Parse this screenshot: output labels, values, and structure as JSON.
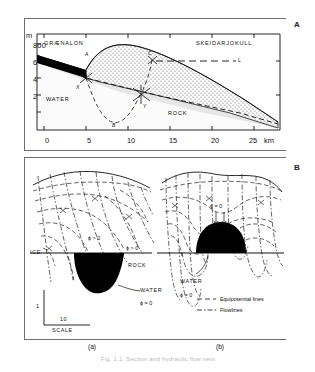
{
  "figure": {
    "panels": [
      {
        "letter": "A"
      },
      {
        "letter": "B"
      }
    ],
    "caption": "Fig. 1.1. Section and hydraulic flow nets"
  },
  "panelA": {
    "yaxis": {
      "unit": "m",
      "ticks": [
        "800",
        "600",
        "400",
        "200",
        "0"
      ]
    },
    "xaxis": {
      "ticks": [
        "0",
        "5",
        "10",
        "15",
        "20",
        "25"
      ],
      "unit": "km"
    },
    "region_labels": {
      "left": "GRÆNALON",
      "right": "SKEIDARJOKULL",
      "water": "WATER",
      "rock": "ROCK"
    },
    "point_labels": [
      "A",
      "B",
      "C",
      "X",
      "Y"
    ],
    "level_label": "L"
  },
  "panelB": {
    "subpanels": [
      {
        "caption": "(a)"
      },
      {
        "caption": "(b)"
      }
    ],
    "labels_a": {
      "ice": "ICE",
      "rock": "ROCK",
      "water": "WATER",
      "phi_zero": "ϕ = 0",
      "phi_pos_left": "ϕ > 0",
      "phi_pos_right": "ϕ > 0"
    },
    "labels_b": {
      "water": "WATER",
      "phi_zero_bottom": "ϕ = 0",
      "phi_zero_top": "ϕ = 0"
    },
    "scale": {
      "vertical": "1",
      "horizontal": "10",
      "label": "SCALE"
    },
    "legend": [
      {
        "name": "equipotential-lines",
        "label": "Equipotential lines"
      },
      {
        "name": "flowlines",
        "label": "Flowlines"
      }
    ]
  },
  "colors": {
    "ink": "#111111",
    "frame": "#6e6e6e",
    "water_fill": "#000000",
    "ice_hatch": "#555555"
  }
}
